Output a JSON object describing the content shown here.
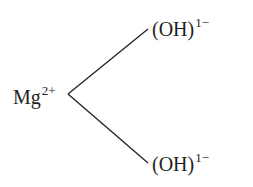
{
  "diagram": {
    "center": {
      "label": "Mg",
      "charge": "2+"
    },
    "ligands": [
      {
        "label": "(OH)",
        "charge": "1−"
      },
      {
        "label": "(OH)",
        "charge": "1−"
      }
    ],
    "colors": {
      "ink": "#231f20",
      "background": "#ffffff"
    }
  }
}
